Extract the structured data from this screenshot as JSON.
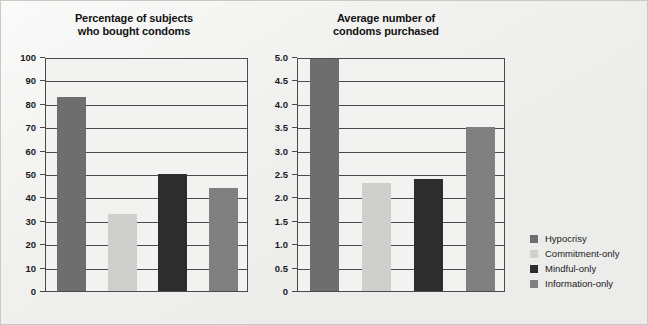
{
  "figure": {
    "background_color": "#ececea",
    "plot_background_color": "#f2f2f0",
    "axis_color": "#4a4a4a"
  },
  "series_colors": {
    "hypocrisy": "#6e6e6e",
    "commitment_only": "#cfcfcd",
    "mindful_only": "#2d2d2d",
    "information_only": "#808080"
  },
  "legend": {
    "position": "right",
    "items": [
      {
        "label": "Hypocrisy",
        "color": "#6e6e6e"
      },
      {
        "label": "Commitment-only",
        "color": "#cfcfcd"
      },
      {
        "label": "Mindful-only",
        "color": "#2d2d2d"
      },
      {
        "label": "Information-only",
        "color": "#808080"
      }
    ]
  },
  "chart_data": [
    {
      "type": "bar",
      "title": "Percentage of subjects\nwho bought condoms",
      "xlabel": "",
      "ylabel": "",
      "categories": [
        "Hypocrisy",
        "Commitment-only",
        "Mindful-only",
        "Information-only"
      ],
      "values": [
        83,
        33,
        50,
        44
      ],
      "colors": [
        "#6e6e6e",
        "#cfcfcd",
        "#2d2d2d",
        "#808080"
      ],
      "ylim": [
        0,
        100
      ],
      "yticks": [
        0,
        10,
        20,
        30,
        40,
        50,
        60,
        70,
        80,
        90,
        100
      ],
      "ytick_labels": [
        "0",
        "10",
        "20",
        "30",
        "40",
        "50",
        "60",
        "70",
        "80",
        "90",
        "100"
      ],
      "grid": true,
      "legend": false
    },
    {
      "type": "bar",
      "title": "Average number of\ncondoms purchased",
      "xlabel": "",
      "ylabel": "",
      "categories": [
        "Hypocrisy",
        "Commitment-only",
        "Mindful-only",
        "Information-only"
      ],
      "values": [
        4.95,
        2.3,
        2.4,
        3.5
      ],
      "colors": [
        "#6e6e6e",
        "#cfcfcd",
        "#2d2d2d",
        "#808080"
      ],
      "ylim": [
        0,
        5.0
      ],
      "yticks": [
        0,
        0.5,
        1.0,
        1.5,
        2.0,
        2.5,
        3.0,
        3.5,
        4.0,
        4.5,
        5.0
      ],
      "ytick_labels": [
        "0",
        "0.5",
        "1.0",
        "1.5",
        "2.0",
        "2.5",
        "3.0",
        "3.5",
        "4.0",
        "4.5",
        "5.0"
      ],
      "grid": true,
      "legend": false
    }
  ]
}
